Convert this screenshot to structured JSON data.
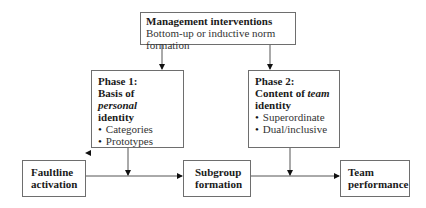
{
  "management": {
    "title": "Management interventions",
    "line1": "Bottom-up or inductive norm",
    "line2": "formation"
  },
  "phase1": {
    "line1": "Phase 1:",
    "line2": "Basis of",
    "line3_italic": "personal",
    "line4": "identity",
    "bullets": [
      "Categories",
      "Prototypes"
    ]
  },
  "phase2": {
    "line1": "Phase 2:",
    "line2_pre": "Content of ",
    "line2_italic": "team",
    "line3": "identity",
    "bullets": [
      "Superordinate",
      "Dual/inclusive"
    ]
  },
  "faultline": {
    "line1": "Faultline",
    "line2": "activation"
  },
  "subgroup": {
    "line1": "Subgroup",
    "line2": "formation"
  },
  "team": {
    "line1": "Team",
    "line2": "performance"
  }
}
